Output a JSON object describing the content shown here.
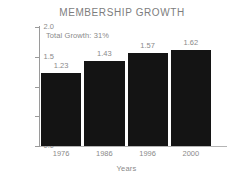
{
  "chart_data": {
    "type": "bar",
    "title": "MEMBERSHIP GROWTH",
    "xlabel": "Years",
    "ylabel": "Millions",
    "categories": [
      "1976",
      "1986",
      "1996",
      "2000"
    ],
    "values": [
      1.23,
      1.43,
      1.57,
      1.62
    ],
    "value_labels": [
      "1.23",
      "1.43",
      "1.57",
      "1.62"
    ],
    "ylim": [
      0.0,
      2.0
    ],
    "ytick_labels": [
      "0.0",
      "0.5",
      "1.0",
      "1.5",
      "2.0"
    ],
    "ytick_values": [
      0.0,
      0.5,
      1.0,
      1.5,
      2.0
    ],
    "grid": false,
    "legend": null,
    "annotations": [
      {
        "text": "Total Growth: 31%",
        "position": "upper-left-inside-plot"
      }
    ],
    "bar_color": "#141414",
    "text_color": "#8a8a8a",
    "axis_color": "#9a9a9a",
    "background_color": "#ffffff"
  },
  "annotation_text": "Total Growth: 31%"
}
